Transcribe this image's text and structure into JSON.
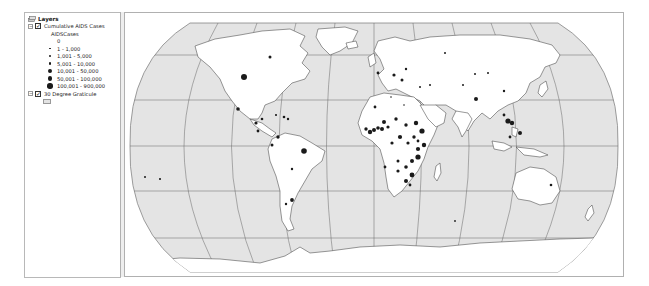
{
  "toc": {
    "title": "Layers",
    "layers": [
      {
        "name": "Cumulative AIDS Cases",
        "checked": true,
        "field": "AIDSCases",
        "classes": [
          {
            "label": "0",
            "size": 0
          },
          {
            "label": "1 - 1,000",
            "size": 1.2
          },
          {
            "label": "1,001 - 5,000",
            "size": 2
          },
          {
            "label": "5,001 - 10,000",
            "size": 2.8
          },
          {
            "label": "10,001 - 50,000",
            "size": 3.8
          },
          {
            "label": "50,001 - 100,000",
            "size": 4.8
          },
          {
            "label": "100,001 - 900,000",
            "size": 5.8
          }
        ]
      },
      {
        "name": "30 Degree Graticule",
        "checked": true
      }
    ]
  },
  "map": {
    "projection": "Robinson (world)",
    "ocean_color": "#e4e4e4",
    "land_color": "#ffffff",
    "line_color": "#555555",
    "symbol_color": "#1a1a1a"
  }
}
